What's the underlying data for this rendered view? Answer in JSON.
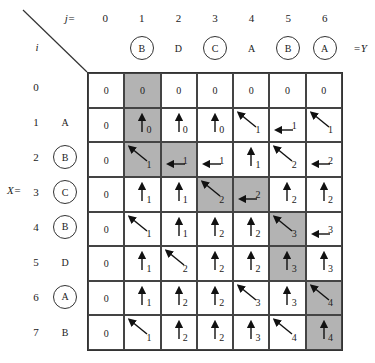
{
  "labels": {
    "j_eq": "j=",
    "i": "i",
    "x_eq": "X=",
    "eq_y": "=Y"
  },
  "columns": [
    {
      "j": "0",
      "char": "",
      "circled": false
    },
    {
      "j": "1",
      "char": "B",
      "circled": true
    },
    {
      "j": "2",
      "char": "D",
      "circled": false
    },
    {
      "j": "3",
      "char": "C",
      "circled": true
    },
    {
      "j": "4",
      "char": "A",
      "circled": false
    },
    {
      "j": "5",
      "char": "B",
      "circled": true
    },
    {
      "j": "6",
      "char": "A",
      "circled": true
    }
  ],
  "rows": [
    {
      "i": "0",
      "char": "",
      "circled": false
    },
    {
      "i": "1",
      "char": "A",
      "circled": false
    },
    {
      "i": "2",
      "char": "B",
      "circled": true
    },
    {
      "i": "3",
      "char": "C",
      "circled": true
    },
    {
      "i": "4",
      "char": "B",
      "circled": true
    },
    {
      "i": "5",
      "char": "D",
      "circled": false
    },
    {
      "i": "6",
      "char": "A",
      "circled": true
    },
    {
      "i": "7",
      "char": "B",
      "circled": false
    }
  ],
  "colors": {
    "shade": "#b3b3b3",
    "line": "#333333"
  },
  "table": [
    [
      {
        "v": "0",
        "a": ""
      },
      {
        "v": "0",
        "a": "",
        "s": true
      },
      {
        "v": "0",
        "a": ""
      },
      {
        "v": "0",
        "a": ""
      },
      {
        "v": "0",
        "a": ""
      },
      {
        "v": "0",
        "a": ""
      },
      {
        "v": "0",
        "a": ""
      }
    ],
    [
      {
        "v": "0",
        "a": ""
      },
      {
        "v": "0",
        "a": "up",
        "s": true
      },
      {
        "v": "0",
        "a": "up"
      },
      {
        "v": "0",
        "a": "up"
      },
      {
        "v": "1",
        "a": "diag"
      },
      {
        "v": "1",
        "a": "left"
      },
      {
        "v": "1",
        "a": "diag"
      }
    ],
    [
      {
        "v": "0",
        "a": ""
      },
      {
        "v": "1",
        "a": "diag",
        "s": true
      },
      {
        "v": "1",
        "a": "left",
        "s": true
      },
      {
        "v": "1",
        "a": "left"
      },
      {
        "v": "1",
        "a": "up"
      },
      {
        "v": "2",
        "a": "diag"
      },
      {
        "v": "2",
        "a": "left"
      }
    ],
    [
      {
        "v": "0",
        "a": ""
      },
      {
        "v": "1",
        "a": "up"
      },
      {
        "v": "1",
        "a": "up"
      },
      {
        "v": "2",
        "a": "diag",
        "s": true
      },
      {
        "v": "2",
        "a": "left",
        "s": true
      },
      {
        "v": "2",
        "a": "up"
      },
      {
        "v": "2",
        "a": "up"
      }
    ],
    [
      {
        "v": "0",
        "a": ""
      },
      {
        "v": "1",
        "a": "diag"
      },
      {
        "v": "1",
        "a": "up"
      },
      {
        "v": "2",
        "a": "up"
      },
      {
        "v": "2",
        "a": "up"
      },
      {
        "v": "3",
        "a": "diag",
        "s": true
      },
      {
        "v": "3",
        "a": "left"
      }
    ],
    [
      {
        "v": "0",
        "a": ""
      },
      {
        "v": "1",
        "a": "up"
      },
      {
        "v": "2",
        "a": "diag"
      },
      {
        "v": "2",
        "a": "up"
      },
      {
        "v": "2",
        "a": "up"
      },
      {
        "v": "3",
        "a": "up",
        "s": true
      },
      {
        "v": "3",
        "a": "up"
      }
    ],
    [
      {
        "v": "0",
        "a": ""
      },
      {
        "v": "1",
        "a": "up"
      },
      {
        "v": "2",
        "a": "up"
      },
      {
        "v": "2",
        "a": "up"
      },
      {
        "v": "3",
        "a": "diag"
      },
      {
        "v": "3",
        "a": "up"
      },
      {
        "v": "4",
        "a": "diag",
        "s": true
      }
    ],
    [
      {
        "v": "0",
        "a": ""
      },
      {
        "v": "1",
        "a": "diag"
      },
      {
        "v": "2",
        "a": "up"
      },
      {
        "v": "2",
        "a": "up"
      },
      {
        "v": "3",
        "a": "up"
      },
      {
        "v": "4",
        "a": "diag"
      },
      {
        "v": "4",
        "a": "up",
        "s": true
      }
    ]
  ]
}
